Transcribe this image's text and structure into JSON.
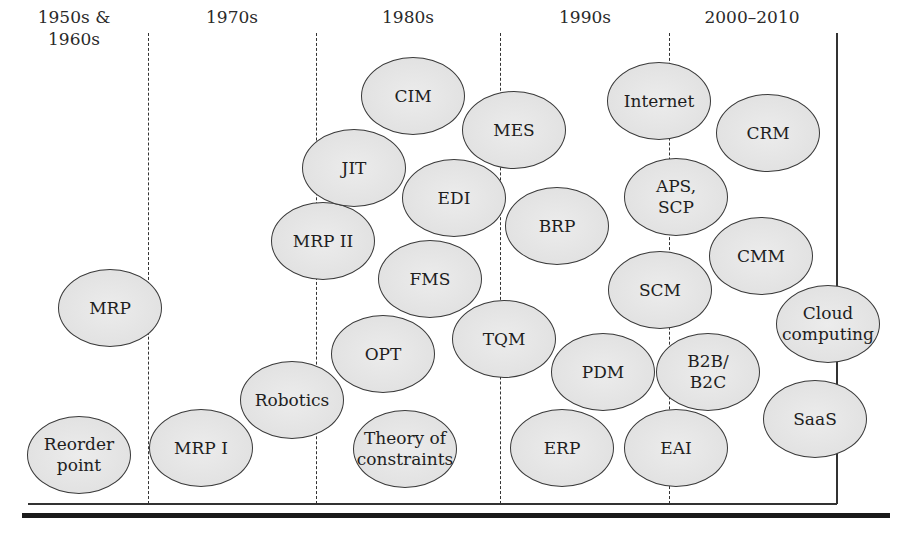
{
  "diagram": {
    "eras": [
      {
        "label": "1950s &\n1960s",
        "x": 74,
        "width": 130
      },
      {
        "label": "1970s",
        "x": 232,
        "width": 120
      },
      {
        "label": "1980s",
        "x": 408,
        "width": 120
      },
      {
        "label": "1990s",
        "x": 585,
        "width": 120
      },
      {
        "label": "2000–2010",
        "x": 752,
        "width": 140
      }
    ],
    "dividers_x": [
      148,
      316,
      500,
      669
    ],
    "bubbles": [
      {
        "id": "reorder-point",
        "label": "Reorder\npoint",
        "era": "1950s & 1960s",
        "x": 79,
        "y": 455
      },
      {
        "id": "mrp",
        "label": "MRP",
        "era": "1950s & 1960s",
        "x": 110,
        "y": 308
      },
      {
        "id": "mrp-i",
        "label": "MRP I",
        "era": "1970s",
        "x": 201,
        "y": 448
      },
      {
        "id": "robotics",
        "label": "Robotics",
        "era": "1970s",
        "x": 292,
        "y": 400
      },
      {
        "id": "mrp-ii",
        "label": "MRP II",
        "era": "1980s",
        "x": 323,
        "y": 241
      },
      {
        "id": "jit",
        "label": "JIT",
        "era": "1980s",
        "x": 354,
        "y": 168
      },
      {
        "id": "cim",
        "label": "CIM",
        "era": "1980s",
        "x": 413,
        "y": 96
      },
      {
        "id": "edi",
        "label": "EDI",
        "era": "1980s",
        "x": 454,
        "y": 198
      },
      {
        "id": "fms",
        "label": "FMS",
        "era": "1980s",
        "x": 430,
        "y": 279
      },
      {
        "id": "opt",
        "label": "OPT",
        "era": "1980s",
        "x": 383,
        "y": 354
      },
      {
        "id": "theory-of-constraints",
        "label": "Theory of\nconstraints",
        "era": "1980s",
        "x": 405,
        "y": 449
      },
      {
        "id": "mes",
        "label": "MES",
        "era": "1990s",
        "x": 514,
        "y": 130
      },
      {
        "id": "tqm",
        "label": "TQM",
        "era": "1990s",
        "x": 504,
        "y": 339
      },
      {
        "id": "brp",
        "label": "BRP",
        "era": "1990s",
        "x": 557,
        "y": 226
      },
      {
        "id": "pdm",
        "label": "PDM",
        "era": "1990s",
        "x": 603,
        "y": 372
      },
      {
        "id": "erp",
        "label": "ERP",
        "era": "1990s",
        "x": 562,
        "y": 448
      },
      {
        "id": "internet",
        "label": "Internet",
        "era": "2000–2010",
        "x": 659,
        "y": 101
      },
      {
        "id": "aps-scp",
        "label": "APS,\nSCP",
        "era": "2000–2010",
        "x": 676,
        "y": 197
      },
      {
        "id": "scm",
        "label": "SCM",
        "era": "2000–2010",
        "x": 660,
        "y": 290
      },
      {
        "id": "b2b-b2c",
        "label": "B2B/\nB2C",
        "era": "2000–2010",
        "x": 708,
        "y": 372
      },
      {
        "id": "eai",
        "label": "EAI",
        "era": "2000–2010",
        "x": 676,
        "y": 448
      },
      {
        "id": "crm",
        "label": "CRM",
        "era": "2000–2010",
        "x": 768,
        "y": 133
      },
      {
        "id": "cmm",
        "label": "CMM",
        "era": "2000–2010",
        "x": 761,
        "y": 256
      },
      {
        "id": "cloud-computing",
        "label": "Cloud\ncomputing",
        "era": "2000–2010",
        "x": 828,
        "y": 324
      },
      {
        "id": "saas",
        "label": "SaaS",
        "era": "2000–2010",
        "x": 815,
        "y": 419
      }
    ],
    "colors": {
      "bubble_fill": "#e4e4e4",
      "bubble_stroke": "#3a3a3a",
      "line": "#333333"
    }
  }
}
